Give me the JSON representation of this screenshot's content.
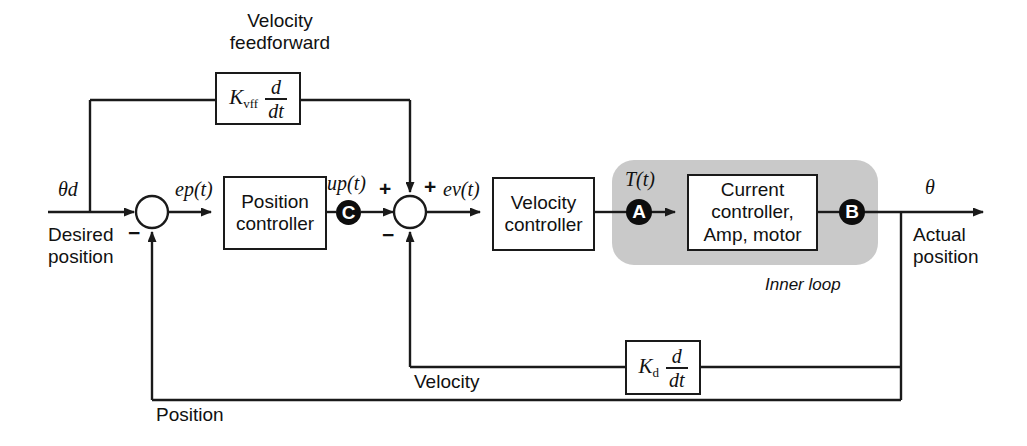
{
  "diagram": {
    "title_feedforward": "Velocity\nfeedforward",
    "feedforward_title_line1": "Velocity",
    "feedforward_title_line2": "feedforward",
    "inner_loop_label": "Inner loop",
    "labels": {
      "theta_d": "θd",
      "theta_out": "θ",
      "desired_position_line1": "Desired",
      "desired_position_line2": "position",
      "actual_position_line1": "Actual",
      "actual_position_line2": "position",
      "error_position": "ep(t)",
      "control_position": "up(t)",
      "error_velocity": "ev(t)",
      "torque": "T(t)",
      "velocity_feedback": "Velocity",
      "position_feedback": "Position"
    },
    "blocks": [
      {
        "id": "position-controller",
        "line1": "Position",
        "line2": "controller"
      },
      {
        "id": "velocity-controller",
        "line1": "Velocity",
        "line2": "controller"
      },
      {
        "id": "plant",
        "line1": "Current",
        "line2": "controller,",
        "line3": "Amp, motor"
      }
    ],
    "gain_blocks": [
      {
        "id": "kvff",
        "gain": "K",
        "gain_sub": "vff",
        "numerator": "d",
        "denominator": "dt"
      },
      {
        "id": "kd",
        "gain": "K",
        "gain_sub": "d",
        "numerator": "d",
        "denominator": "dt"
      }
    ],
    "nodes": [
      {
        "id": "node-c",
        "letter": "C"
      },
      {
        "id": "node-a",
        "letter": "A"
      },
      {
        "id": "node-b",
        "letter": "B"
      }
    ],
    "summing_junctions": [
      {
        "id": "sum-position",
        "signs": [
          "−"
        ]
      },
      {
        "id": "sum-velocity",
        "signs": [
          "+",
          "+",
          "−"
        ]
      }
    ],
    "signs": {
      "minus": "−",
      "plus": "+"
    },
    "colors": {
      "line": "#1a1a1a",
      "node_fill": "#0d0d0d",
      "inner_loop_bg": "#c9c9c9",
      "text": "#111111",
      "background": "#ffffff"
    }
  }
}
